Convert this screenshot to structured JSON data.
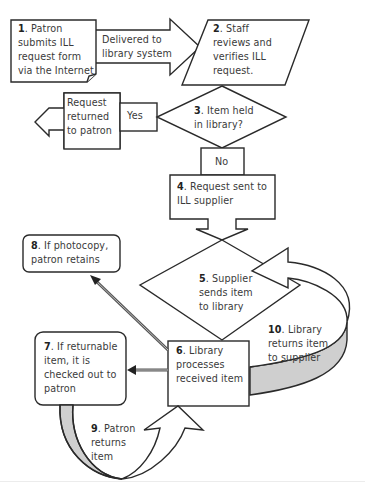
{
  "diagram": {
    "colors": {
      "stroke": "#2a2a2a",
      "fill": "#ffffff",
      "shade": "#cfcfcf",
      "text": "#3a3a3a"
    },
    "steps": [
      {
        "num": "1",
        "text": ". Patron submits ILL request form via the Internet",
        "lines": [
          "Patron",
          "submits ILL",
          "request form",
          "via the Internet"
        ],
        "shape": "document"
      },
      {
        "num": "2",
        "text": ". Staff reviews and verifies ILL request.",
        "lines": [
          "Staff",
          "reviews and",
          "verifies ILL",
          "request."
        ],
        "shape": "parallelogram"
      },
      {
        "num": "3",
        "text": ". Item held in library?",
        "lines": [
          "Item held",
          "in library?"
        ],
        "shape": "diamond"
      },
      {
        "num": "4",
        "text": ". Request sent to ILL supplier",
        "lines": [
          "Request sent to",
          "ILL supplier"
        ],
        "shape": "rectangle-arrow"
      },
      {
        "num": "5",
        "text": ". Supplier sends item to library",
        "lines": [
          "Supplier",
          "sends item",
          "to library"
        ],
        "shape": "diamond"
      },
      {
        "num": "6",
        "text": ". Library processes received item",
        "lines": [
          "Library",
          "processes",
          "received item"
        ],
        "shape": "rectangle"
      },
      {
        "num": "7",
        "text": ". If returnable item, it is checked out to patron",
        "lines": [
          "If returnable",
          "item, it is",
          "checked out to",
          "patron"
        ],
        "shape": "rounded-rectangle"
      },
      {
        "num": "8",
        "text": ". If photocopy, patron retains",
        "lines": [
          "If photocopy,",
          "patron retains"
        ],
        "shape": "rounded-rectangle"
      },
      {
        "num": "9",
        "text": ". Patron returns item",
        "lines": [
          "Patron",
          "returns",
          "item"
        ],
        "shape": "curved-arrow"
      },
      {
        "num": "10",
        "text": ". Library returns item to supplier",
        "lines": [
          "Library",
          "returns item",
          "to supplier"
        ],
        "shape": "curved-arrow"
      }
    ],
    "connectors": {
      "delivered": [
        "Delivered to",
        "library system"
      ],
      "request_returned": [
        "Request",
        "returned",
        "to patron"
      ],
      "yes": "Yes",
      "no": "No"
    }
  }
}
